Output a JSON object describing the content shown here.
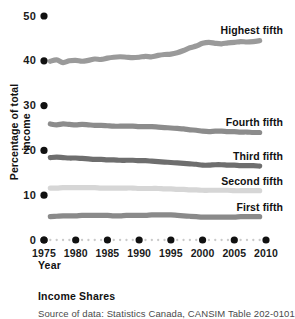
{
  "caption": "Income Shares",
  "source": "Source of data: Statistics Canada, CANSIM Table 202-0101",
  "axes": {
    "ylabel": "Percentage of total income",
    "xlabel": "Year",
    "yticks": [
      "50",
      "40",
      "30",
      "20",
      "10",
      "0"
    ],
    "xticks": [
      "1975",
      "1980",
      "1985",
      "1990",
      "1995",
      "2000",
      "2005",
      "2010"
    ]
  },
  "labels": {
    "highest": "Highest fifth",
    "fourth": "Fourth fifth",
    "third": "Third fifth",
    "second": "Second fifth",
    "first": "First fifth"
  },
  "chart_data": {
    "type": "line",
    "title": "Income Shares",
    "xlabel": "Year",
    "ylabel": "Percentage of total income",
    "xlim": [
      1975,
      2010
    ],
    "ylim": [
      0,
      50
    ],
    "ytick_values": [
      0,
      10,
      20,
      30,
      40,
      50
    ],
    "xtick_values": [
      1975,
      1980,
      1985,
      1990,
      1995,
      2000,
      2005,
      2010
    ],
    "grid": false,
    "legend": "inline-right-end-of-each-series",
    "x": [
      1976,
      1977,
      1978,
      1979,
      1980,
      1981,
      1982,
      1983,
      1984,
      1985,
      1986,
      1987,
      1988,
      1989,
      1990,
      1991,
      1992,
      1993,
      1994,
      1995,
      1996,
      1997,
      1998,
      1999,
      2000,
      2001,
      2002,
      2003,
      2004,
      2005,
      2006,
      2007,
      2008,
      2009
    ],
    "series": [
      {
        "name": "Highest fifth",
        "color": "#9a9a9a",
        "values": [
          39.9,
          40.2,
          39.6,
          40.0,
          40.1,
          39.9,
          40.1,
          40.4,
          40.3,
          40.6,
          40.8,
          40.9,
          40.8,
          40.7,
          40.8,
          41.0,
          40.9,
          41.2,
          41.4,
          41.5,
          41.8,
          42.3,
          42.9,
          43.3,
          43.9,
          44.1,
          43.9,
          43.8,
          44.0,
          44.1,
          44.3,
          44.2,
          44.3,
          44.5
        ]
      },
      {
        "name": "Fourth fifth",
        "color": "#8c8c8c",
        "values": [
          25.9,
          25.7,
          25.9,
          25.8,
          25.7,
          25.8,
          25.7,
          25.6,
          25.6,
          25.5,
          25.4,
          25.4,
          25.4,
          25.4,
          25.3,
          25.3,
          25.3,
          25.2,
          25.1,
          25.0,
          24.9,
          24.8,
          24.6,
          24.5,
          24.3,
          24.2,
          24.3,
          24.3,
          24.2,
          24.2,
          24.1,
          24.1,
          24.0,
          24.0
        ]
      },
      {
        "name": "Third fifth",
        "color": "#6e6e6e",
        "values": [
          18.4,
          18.5,
          18.4,
          18.3,
          18.3,
          18.2,
          18.1,
          18.0,
          18.0,
          17.9,
          17.9,
          17.8,
          17.8,
          17.8,
          17.7,
          17.7,
          17.6,
          17.5,
          17.4,
          17.3,
          17.2,
          17.1,
          17.0,
          16.9,
          16.7,
          16.7,
          16.8,
          16.8,
          16.7,
          16.7,
          16.6,
          16.6,
          16.6,
          16.5
        ]
      },
      {
        "name": "Second fifth",
        "color": "#d6d6d6",
        "values": [
          11.6,
          11.6,
          11.7,
          11.7,
          11.7,
          11.7,
          11.7,
          11.7,
          11.6,
          11.6,
          11.6,
          11.6,
          11.6,
          11.6,
          11.5,
          11.5,
          11.5,
          11.5,
          11.4,
          11.4,
          11.3,
          11.3,
          11.2,
          11.2,
          11.1,
          11.1,
          11.1,
          11.1,
          11.1,
          11.0,
          11.0,
          11.0,
          11.0,
          11.0
        ]
      },
      {
        "name": "First fifth",
        "color": "#8a8a8a",
        "values": [
          5.2,
          5.3,
          5.4,
          5.4,
          5.4,
          5.5,
          5.5,
          5.5,
          5.5,
          5.5,
          5.4,
          5.4,
          5.5,
          5.5,
          5.5,
          5.5,
          5.6,
          5.6,
          5.6,
          5.6,
          5.5,
          5.4,
          5.3,
          5.2,
          5.1,
          5.1,
          5.1,
          5.1,
          5.1,
          5.1,
          5.2,
          5.2,
          5.2,
          5.2
        ]
      }
    ]
  }
}
